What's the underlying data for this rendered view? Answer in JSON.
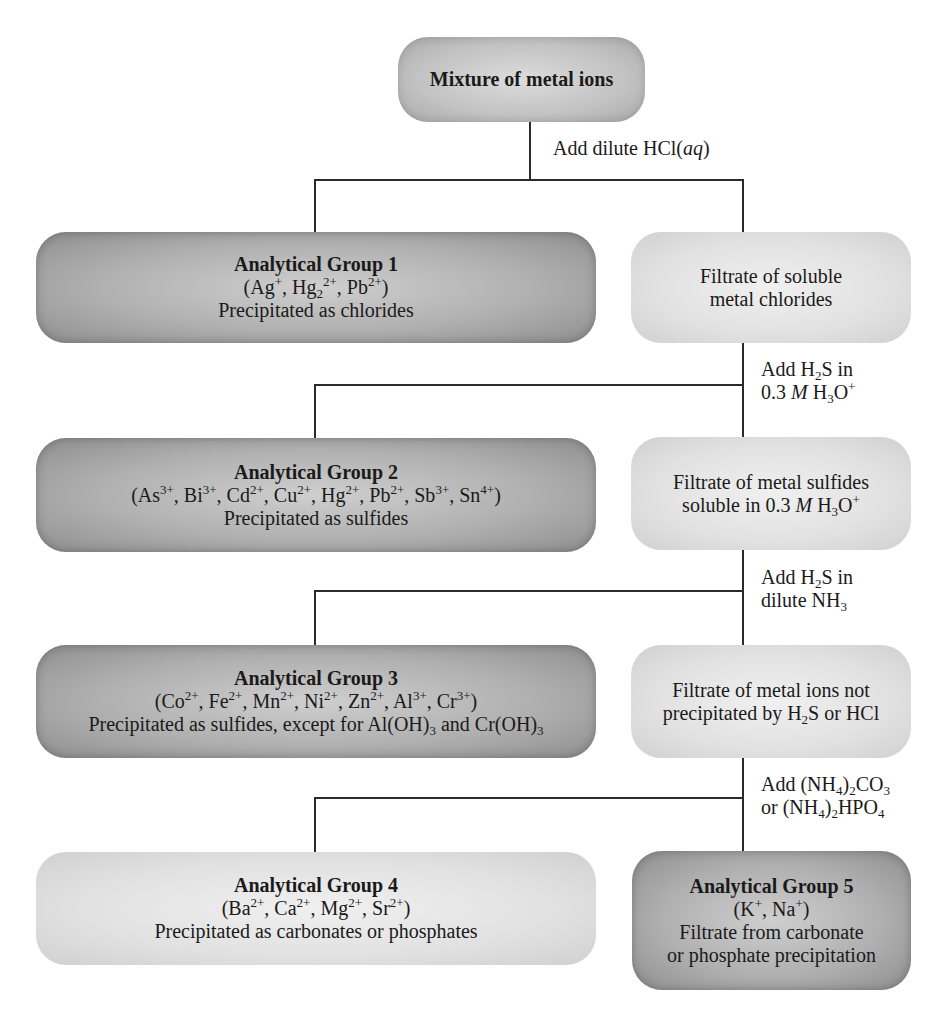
{
  "top": {
    "title": "Mixture of metal ions"
  },
  "steps": [
    {
      "reagent_lines": [
        "Add dilute HCl(aq)"
      ]
    },
    {
      "reagent_lines": [
        "Add H2S in",
        "0.3 M H3O+"
      ]
    },
    {
      "reagent_lines": [
        "Add H2S in",
        "dilute NH3"
      ]
    },
    {
      "reagent_lines": [
        "Add (NH4)2CO3",
        "or (NH4)2HPO4"
      ]
    }
  ],
  "groups": [
    {
      "title": "Analytical Group 1",
      "ions": "(Ag+, Hg2 2+, Pb2+)",
      "note": "Precipitated as chlorides"
    },
    {
      "title": "Analytical Group 2",
      "ions": "(As3+, Bi3+, Cd2+, Cu2+, Hg2+, Pb2+, Sb3+, Sn4+)",
      "note": "Precipitated as sulfides"
    },
    {
      "title": "Analytical Group 3",
      "ions": "(Co2+, Fe2+, Mn2+, Ni2+, Zn2+, Al3+, Cr3+)",
      "note": "Precipitated as sulfides, except for Al(OH)3 and Cr(OH)3"
    },
    {
      "title": "Analytical Group 4",
      "ions": "(Ba2+, Ca2+, Mg2+, Sr2+)",
      "note": "Precipitated as carbonates or phosphates"
    },
    {
      "title": "Analytical Group 5",
      "ions": "(K+, Na+)",
      "note_lines": [
        "Filtrate from carbonate",
        "or phosphate precipitation"
      ]
    }
  ],
  "filtrates": [
    {
      "lines": [
        "Filtrate of soluble",
        "metal chlorides"
      ]
    },
    {
      "lines": [
        "Filtrate of metal sulfides",
        "soluble in 0.3 M H3O+"
      ]
    },
    {
      "lines": [
        "Filtrate of metal ions not",
        "precipitated by H2S or HCl"
      ]
    }
  ],
  "colors": {
    "line": "#2a2a2a",
    "dark_box": "#a8a8a8",
    "light_box": "#e1e1e1",
    "text": "#1a1a1a"
  }
}
